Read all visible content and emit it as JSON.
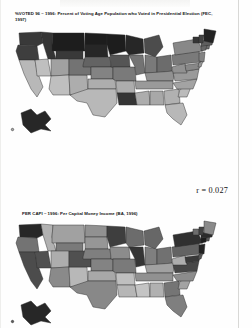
{
  "document": {
    "type": "scanned-figure-page",
    "background_color": "#fefefe"
  },
  "figures": [
    {
      "id": "map-voter-turnout",
      "caption": "%VOTED 96 – 1996: Percent of Voting Age Population who Voted in Presidential Election (FEC, 1997)",
      "variable_name": "%VOTED 96",
      "year": "1996",
      "source": "FEC, 1997",
      "map_type": "choropleth",
      "region": "United States"
    },
    {
      "id": "map-per-capita-income",
      "caption": "PER CAPI – 1996:  Per Capital Money Income (BA, 1996)",
      "variable_name": "PER CAPI",
      "year": "1996",
      "source": "BA, 1996",
      "map_type": "choropleth",
      "region": "United States"
    }
  ],
  "statistics": {
    "correlation_label": "r = 0.027",
    "correlation_value": "0.027"
  },
  "chart_data": {
    "type": "heatmap",
    "xlabel": "",
    "ylabel": "",
    "legend_position": "none",
    "grid": false,
    "annotations": [
      "r = 0.027"
    ],
    "series": [
      {
        "name": "%VOTED 96 – 1996: Percent of Voting Age Population who Voted in Presidential Election (FEC, 1997)",
        "categories": [
          "WA",
          "OR",
          "CA",
          "NV",
          "ID",
          "MT",
          "WY",
          "UT",
          "AZ",
          "NM",
          "CO",
          "ND",
          "SD",
          "NE",
          "KS",
          "OK",
          "TX",
          "MN",
          "IA",
          "MO",
          "AR",
          "LA",
          "WI",
          "IL",
          "MI",
          "IN",
          "OH",
          "KY",
          "TN",
          "MS",
          "AL",
          "GA",
          "FL",
          "SC",
          "NC",
          "VA",
          "WV",
          "MD",
          "DE",
          "PA",
          "NJ",
          "NY",
          "CT",
          "RI",
          "MA",
          "VT",
          "NH",
          "ME",
          "AK",
          "HI"
        ],
        "values": [
          0.8,
          0.78,
          0.25,
          0.22,
          0.82,
          0.92,
          0.8,
          0.35,
          0.22,
          0.3,
          0.55,
          0.92,
          0.88,
          0.62,
          0.48,
          0.3,
          0.25,
          0.92,
          0.68,
          0.52,
          0.3,
          0.82,
          0.88,
          0.55,
          0.72,
          0.52,
          0.58,
          0.42,
          0.38,
          0.3,
          0.32,
          0.28,
          0.25,
          0.24,
          0.34,
          0.38,
          0.42,
          0.46,
          0.4,
          0.52,
          0.48,
          0.46,
          0.6,
          0.58,
          0.64,
          0.82,
          0.76,
          0.9,
          0.88,
          0.3
        ]
      },
      {
        "name": "PER CAPI – 1996: Per Capital Money Income (BA, 1996)",
        "categories": [
          "WA",
          "OR",
          "CA",
          "NV",
          "ID",
          "MT",
          "WY",
          "UT",
          "AZ",
          "NM",
          "CO",
          "ND",
          "SD",
          "NE",
          "KS",
          "OK",
          "TX",
          "MN",
          "IA",
          "MO",
          "AR",
          "LA",
          "WI",
          "IL",
          "MI",
          "IN",
          "OH",
          "KY",
          "TN",
          "MS",
          "AL",
          "GA",
          "FL",
          "SC",
          "NC",
          "VA",
          "WV",
          "MD",
          "DE",
          "PA",
          "NJ",
          "NY",
          "CT",
          "RI",
          "MA",
          "VT",
          "NH",
          "ME",
          "AK",
          "HI"
        ],
        "values": [
          0.88,
          0.55,
          0.72,
          0.7,
          0.28,
          0.35,
          0.52,
          0.3,
          0.45,
          0.25,
          0.7,
          0.42,
          0.4,
          0.5,
          0.48,
          0.32,
          0.46,
          0.78,
          0.44,
          0.52,
          0.22,
          0.26,
          0.58,
          0.82,
          0.6,
          0.5,
          0.56,
          0.35,
          0.42,
          0.2,
          0.28,
          0.54,
          0.5,
          0.34,
          0.44,
          0.74,
          0.3,
          0.8,
          0.68,
          0.62,
          0.9,
          0.84,
          0.92,
          0.66,
          0.86,
          0.58,
          0.76,
          0.45,
          0.88,
          0.64
        ]
      }
    ],
    "scale": {
      "description": "grayscale shading, darker = higher value",
      "low_color": "#f2f2f2",
      "high_color": "#111111"
    }
  },
  "states": {
    "labels": [
      "WA",
      "OR",
      "CA",
      "NV",
      "ID",
      "MT",
      "WY",
      "UT",
      "AZ",
      "NM",
      "CO",
      "ND",
      "SD",
      "NE",
      "KS",
      "OK",
      "TX",
      "MN",
      "IA",
      "MO",
      "AR",
      "LA",
      "WI",
      "IL",
      "MI",
      "IN",
      "OH",
      "KY",
      "TN",
      "MS",
      "AL",
      "GA",
      "FL",
      "SC",
      "NC",
      "VA",
      "WV",
      "MD",
      "DE",
      "PA",
      "NJ",
      "NY",
      "CT",
      "RI",
      "MA",
      "VT",
      "NH",
      "ME",
      "AK",
      "HI"
    ]
  }
}
